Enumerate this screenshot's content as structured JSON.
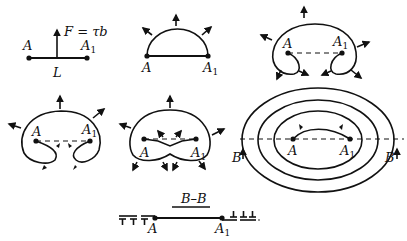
{
  "figure": {
    "panels": [
      {
        "id": "straight-segment",
        "labels": {
          "left": "A",
          "right": "A",
          "right_sub": "1",
          "mid": "L",
          "force": "F = τb"
        }
      },
      {
        "id": "semicircle-bowing",
        "labels": {
          "left": "A",
          "right": "A",
          "right_sub": "1"
        }
      },
      {
        "id": "curl-stage",
        "labels": {
          "left": "A",
          "right": "A",
          "right_sub": "1"
        }
      },
      {
        "id": "loops-approach",
        "labels": {
          "left": "A",
          "right": "A",
          "right_sub": "1"
        }
      },
      {
        "id": "loops-joined",
        "labels": {
          "left": "A",
          "right": "A",
          "right_sub": "1"
        }
      },
      {
        "id": "concentric-loops",
        "labels": {
          "left": "A",
          "right": "A",
          "right_sub": "1",
          "section_left": "B",
          "section_right": "B"
        }
      }
    ],
    "section": {
      "title": "B–B",
      "left": "A",
      "right": "A",
      "right_sub": "1"
    }
  }
}
